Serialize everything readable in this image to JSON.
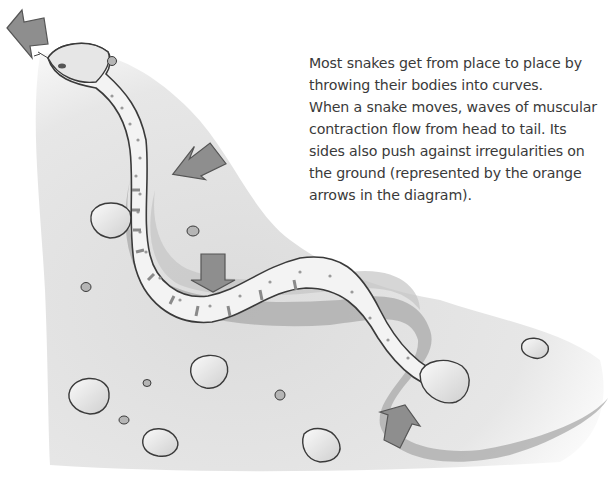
{
  "caption": {
    "lines": [
      "Most snakes get from place to place by",
      "throwing their bodies into curves.",
      "When a snake moves, waves of muscular",
      "contraction flow from head to tail. Its",
      "sides also push against irregularities on",
      "the ground (represented by the orange",
      "arrows in the diagram)."
    ]
  },
  "diagram": {
    "subject": "snake",
    "arrows": [
      {
        "id": "head-direction-arrow",
        "direction": "up-left",
        "meaning": "direction of travel"
      },
      {
        "id": "push-arrow-1",
        "direction": "down-left",
        "meaning": "ground push"
      },
      {
        "id": "push-arrow-2",
        "direction": "down",
        "meaning": "ground push"
      },
      {
        "id": "push-arrow-3",
        "direction": "up-right",
        "meaning": "ground push"
      }
    ],
    "colors": {
      "arrow_fill": "#8e8e8e",
      "arrow_stroke": "#555555",
      "ground": "#dcdcdc",
      "trail": "#a8a8a8",
      "snake_body": "#f2f2f2",
      "outline": "#3a3a3a"
    }
  }
}
